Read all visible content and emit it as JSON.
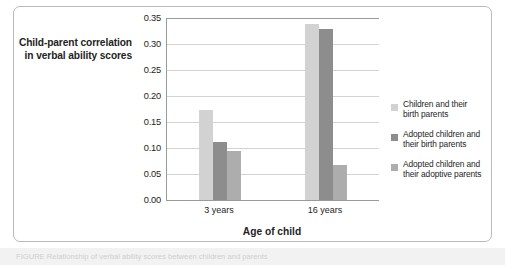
{
  "chart_data": {
    "type": "bar",
    "title": "",
    "xlabel": "Age of child",
    "ylabel": "Child-parent correlation in verbal ability scores",
    "categories": [
      "3 years",
      "16 years"
    ],
    "series": [
      {
        "name": "Children and their birth parents",
        "color": "#d2d2d2",
        "values": [
          0.173,
          0.338
        ]
      },
      {
        "name": "Adopted children and their birth parents",
        "color": "#8d8d8d",
        "values": [
          0.111,
          0.328
        ]
      },
      {
        "name": "Adopted children and their adoptive parents",
        "color": "#adadad",
        "values": [
          0.095,
          0.067
        ]
      }
    ],
    "ylim": [
      0.0,
      0.35
    ],
    "ytick_values": [
      0.0,
      0.05,
      0.1,
      0.15,
      0.2,
      0.25,
      0.3,
      0.35
    ],
    "ytick_labels": [
      "0.00",
      "0.05",
      "0.10",
      "0.15",
      "0.20",
      "0.25",
      "0.30",
      "0.35"
    ],
    "grid": true,
    "legend_position": "right"
  },
  "axis": {
    "y_title_line1": "Child-parent correlation",
    "y_title_line2": "in verbal ability scores",
    "x_title": "Age of child"
  },
  "legend": {
    "items": [
      {
        "line1": "Children and their",
        "line2": "birth parents"
      },
      {
        "line1": "Adopted children and",
        "line2": "their birth parents"
      },
      {
        "line1": "Adopted children and",
        "line2": "their adoptive parents"
      }
    ]
  },
  "caption": {
    "text": "FIGURE  Relationship of verbal ability scores between children and parents"
  },
  "colors": {
    "series1": "#d2d2d2",
    "series2": "#8d8d8d",
    "series3": "#adadad",
    "axis": "#9a9a9a",
    "grid": "#d3d3d3",
    "frame": "#b9b9b9"
  }
}
